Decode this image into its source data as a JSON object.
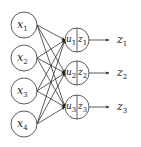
{
  "diagram": {
    "type": "neural-network-layer",
    "inputs": [
      {
        "var": "x",
        "sub": "1",
        "cx": 24,
        "cy": 25
      },
      {
        "var": "x",
        "sub": "2",
        "cx": 24,
        "cy": 58
      },
      {
        "var": "x",
        "sub": "3",
        "cx": 24,
        "cy": 91
      },
      {
        "var": "x",
        "sub": "4",
        "cx": 24,
        "cy": 124
      }
    ],
    "units": [
      {
        "u": "u",
        "u_sub": "1",
        "z": "z",
        "z_sub": "1",
        "cx": 77,
        "cy": 40
      },
      {
        "u": "u",
        "u_sub": "2",
        "z": "z",
        "z_sub": "2",
        "cx": 77,
        "cy": 73
      },
      {
        "u": "u",
        "u_sub": "3",
        "z": "z",
        "z_sub": "3",
        "cx": 77,
        "cy": 107
      }
    ],
    "outputs": [
      {
        "var": "z",
        "sub": "1"
      },
      {
        "var": "z",
        "sub": "2"
      },
      {
        "var": "z",
        "sub": "3"
      }
    ],
    "colors": {
      "stroke": "#333333",
      "background": "#ffffff"
    }
  }
}
